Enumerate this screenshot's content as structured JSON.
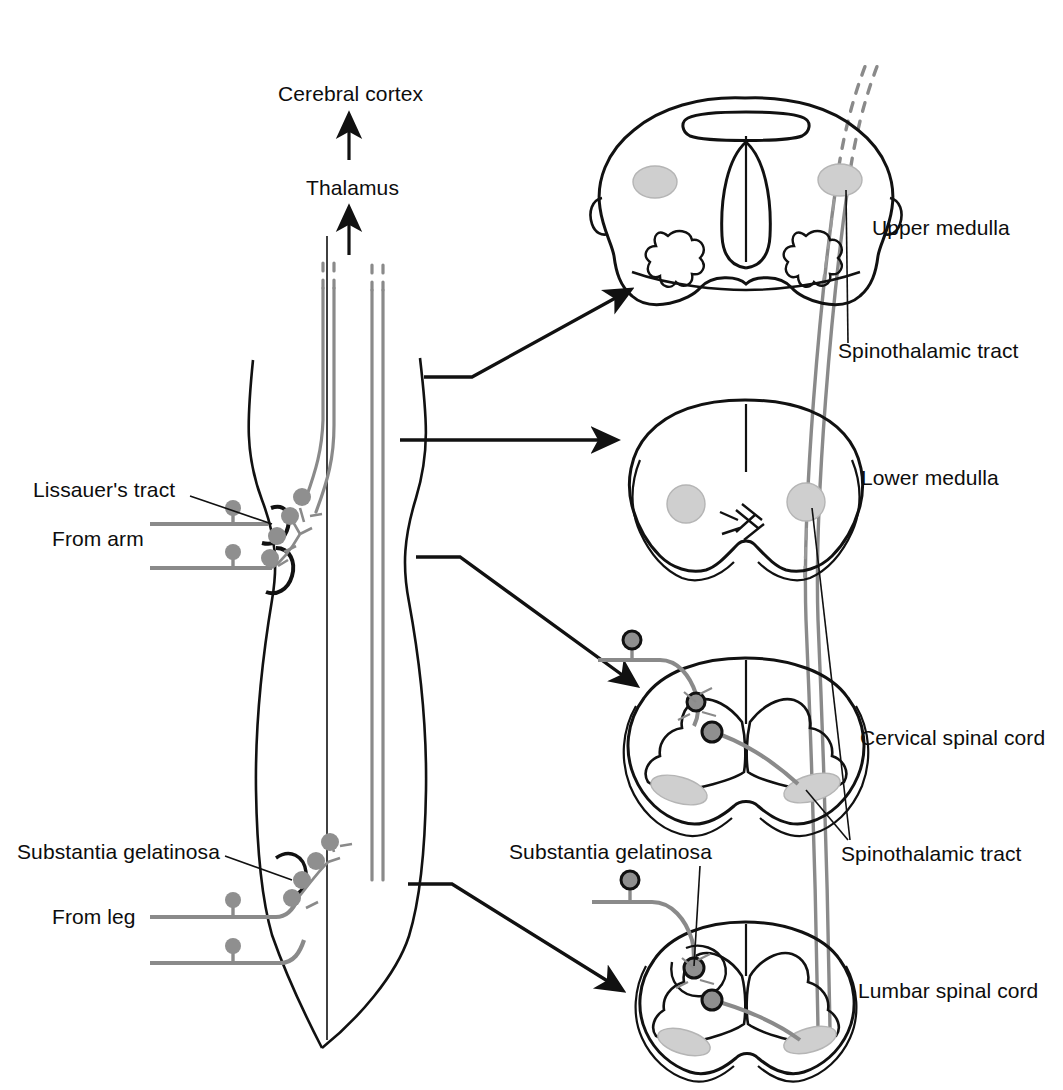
{
  "figure": {
    "colors": {
      "outline": "#111111",
      "fiber_gray": "#8a8a8a",
      "soma_gray": "#8f8f8f",
      "tract_fill": "#cfcfcf",
      "background": "#ffffff"
    }
  },
  "labels": {
    "cerebral_cortex": "Cerebral cortex",
    "thalamus": "Thalamus",
    "lissauers_tract": "Lissauer's tract",
    "from_arm": "From arm",
    "substantia_gelatinosa_left": "Substantia gelatinosa",
    "from_leg": "From leg",
    "substantia_gelatinosa_lumbar": "Substantia gelatinosa",
    "upper_medulla": "Upper medulla",
    "spinothalamic_tract_upper": "Spinothalamic tract",
    "lower_medulla": "Lower medulla",
    "cervical_spinal_cord": "Cervical spinal cord",
    "spinothalamic_tract_cervical": "Spinothalamic tract",
    "lumbar_spinal_cord": "Lumbar spinal cord"
  },
  "sections": [
    {
      "id": "upper-medulla",
      "label": "Upper medulla"
    },
    {
      "id": "lower-medulla",
      "label": "Lower medulla"
    },
    {
      "id": "cervical-spinal-cord",
      "label": "Cervical spinal cord"
    },
    {
      "id": "lumbar-spinal-cord",
      "label": "Lumbar spinal cord"
    }
  ],
  "inputs": [
    {
      "id": "from-arm",
      "label": "From arm",
      "level": "cervical"
    },
    {
      "id": "from-leg",
      "label": "From leg",
      "level": "lumbar"
    }
  ],
  "ascending_targets": [
    {
      "id": "thalamus",
      "label": "Thalamus"
    },
    {
      "id": "cerebral-cortex",
      "label": "Cerebral cortex"
    }
  ]
}
